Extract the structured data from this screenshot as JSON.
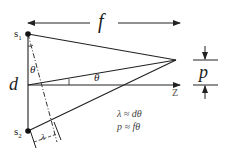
{
  "diagram": {
    "focal_length_label": "f",
    "source1_label": "s",
    "source1_sub": "1",
    "source2_label": "s",
    "source2_sub": "2",
    "separation_label": "d",
    "angle_label_1": "θ",
    "angle_label_2": "θ",
    "axis_label": "Z",
    "wavelength_marker": "λ",
    "spot_label": "p",
    "equations": [
      "λ ≈ dθ",
      "p ≈ fθ"
    ],
    "colors": {
      "line": "#222222",
      "background": "#ffffff"
    }
  }
}
